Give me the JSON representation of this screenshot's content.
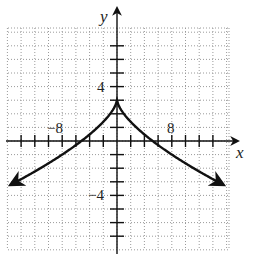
{
  "chart_data": {
    "type": "line",
    "title": "",
    "xlabel": "x",
    "ylabel": "y",
    "xlim": [
      -16,
      16
    ],
    "ylim": [
      -8,
      8
    ],
    "grid": true,
    "x_tick_step": 2,
    "y_tick_step": 1,
    "x_tick_labels": [
      {
        "value": -8,
        "label": "−8"
      },
      {
        "value": 8,
        "label": "8"
      }
    ],
    "y_tick_labels": [
      {
        "value": 4,
        "label": "4"
      },
      {
        "value": -4,
        "label": "−4"
      }
    ],
    "series": [
      {
        "name": "y = 3 − |x|^(2/3)",
        "description": "Cusp at (0, 3), decreasing on both sides, arrows at both ends",
        "x": [
          -15.5,
          -12,
          -8,
          -5.2,
          -3,
          -1,
          0,
          1,
          3,
          5.2,
          8,
          12,
          15.5
        ],
        "y": [
          -3.2,
          -2.24,
          -1,
          0,
          0.92,
          2,
          3,
          2,
          0.92,
          0,
          -1,
          -2.24,
          -3.2
        ]
      }
    ],
    "key_points": {
      "cusp": [
        0,
        3
      ],
      "x_intercepts": [
        -5.2,
        5.2
      ]
    }
  },
  "labels": {
    "x_axis": "x",
    "y_axis": "y",
    "x_neg": "−8",
    "x_pos": "8",
    "y_pos": "4",
    "y_neg": "−4"
  },
  "colors": {
    "curve": "#111111",
    "axes": "#111111",
    "grid": "#9a9a9a"
  }
}
